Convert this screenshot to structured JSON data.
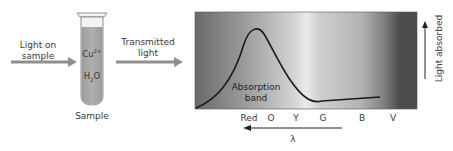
{
  "input_light": {
    "label_line1": "Light on",
    "label_line2": "sample"
  },
  "sample": {
    "label": "Sample",
    "ion": "Cu",
    "ion_charge": "2+",
    "solvent_h": "H",
    "solvent_sub": "2",
    "solvent_o": "O",
    "tube_fill_color": "#a8a8a8"
  },
  "transmitted_light": {
    "label_line1": "Transmitted",
    "label_line2": "light"
  },
  "spectrum": {
    "band_label_line1": "Absorption",
    "band_label_line2": "band",
    "y_axis_label": "Light absorbed",
    "x_axis_label": "λ",
    "color_labels": [
      "Red",
      "O",
      "Y",
      "G",
      "B",
      "V"
    ],
    "gradient_colors": [
      "#6e6e6e",
      "#bdbdbd",
      "#e2e2e2",
      "#c8c8c8",
      "#a9a9a9",
      "#505050"
    ]
  },
  "colors": {
    "arrow": "#8a8a8a",
    "curve": "#1a1a1a",
    "text": "#3a3a3a"
  }
}
